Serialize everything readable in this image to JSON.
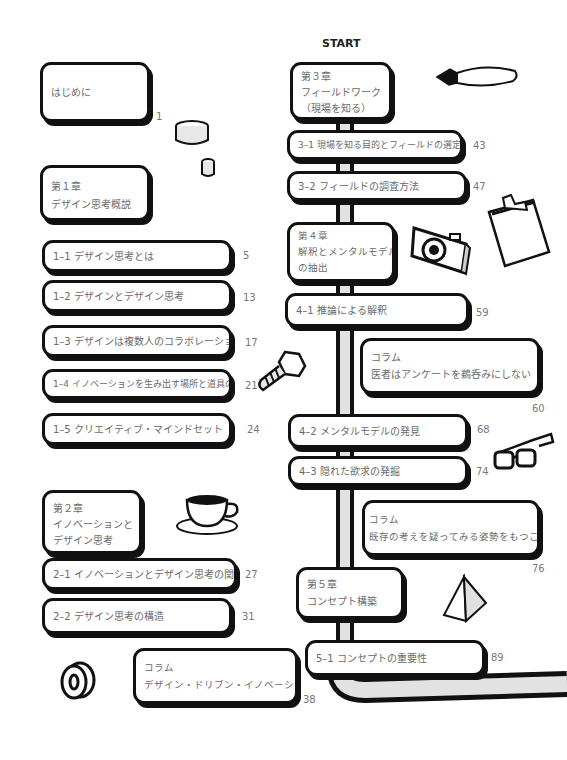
{
  "start_label": "START",
  "left_column": {
    "intro": {
      "title": "はじめに",
      "page": "1"
    },
    "chapter1": {
      "number": "第１章",
      "title": "デザイン思考概説",
      "sections": [
        {
          "label": "1–1  デザイン思考とは",
          "page": "5"
        },
        {
          "label": "1–2  デザインとデザイン思考",
          "page": "13"
        },
        {
          "label": "1–3  デザインは複数人のコラボレーション",
          "page": "17"
        },
        {
          "label": "1–4  イノベーションを生み出す場所と道具の確保",
          "page": "21"
        },
        {
          "label": "1–5  クリエイティブ・マインドセット",
          "page": "24"
        }
      ]
    },
    "chapter2": {
      "number": "第２章",
      "title_line1": "イノベーションと",
      "title_line2": "デザイン思考",
      "sections": [
        {
          "label": "2–1  イノベーションとデザイン思考の関係",
          "page": "27"
        },
        {
          "label": "2–2  デザイン思考の構造",
          "page": "31"
        }
      ],
      "column": {
        "heading": "コラム",
        "title": "デザイン・ドリブン・イノベーション",
        "page": "38"
      }
    }
  },
  "right_column": {
    "chapter3": {
      "number": "第３章",
      "title_line1": "フィールドワーク",
      "title_line2": "（現場を知る）",
      "sections": [
        {
          "label": "3–1  現場を知る目的とフィールドの選定",
          "page": "43"
        },
        {
          "label": "3–2  フィールドの調査方法",
          "page": "47"
        }
      ]
    },
    "chapter4": {
      "number": "第４章",
      "title_line1": "解釈とメンタルモデル",
      "title_line2": "の抽出",
      "sections": [
        {
          "label": "4–1  推論による解釈",
          "page": "59"
        },
        {
          "label": "4–2  メンタルモデルの発見",
          "page": "68"
        },
        {
          "label": "4–3  隠れた欲求の発掘",
          "page": "74"
        }
      ],
      "columns": [
        {
          "heading": "コラム",
          "title": "医者はアンケートを鵜呑みにしない",
          "page": "60"
        },
        {
          "heading": "コラム",
          "title": "既存の考えを疑ってみる姿勢をもつこと",
          "page": "76"
        }
      ]
    },
    "chapter5": {
      "number": "第５章",
      "title": "コンセプト構築",
      "sections": [
        {
          "label": "5–1  コンセプトの重要性",
          "page": "89"
        }
      ]
    }
  },
  "illustrations": [
    "cup-icon",
    "pen-nib-icon",
    "clipboard-icon",
    "camera-icon",
    "bolt-icon",
    "glasses-icon",
    "coffee-cup-icon",
    "pyramid-icon",
    "tape-roll-icon"
  ]
}
